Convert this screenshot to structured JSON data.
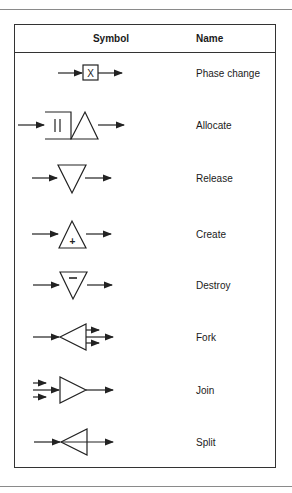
{
  "table": {
    "headers": {
      "symbol": "Symbol",
      "name": "Name"
    },
    "rows": [
      {
        "name": "Phase change",
        "symbol": "box-x-icon",
        "box_label": "X"
      },
      {
        "name": "Allocate",
        "symbol": "queue-triangle-icon",
        "queue_label": "||"
      },
      {
        "name": "Release",
        "symbol": "inverted-triangle-icon"
      },
      {
        "name": "Create",
        "symbol": "triangle-plus-icon",
        "inner": "+"
      },
      {
        "name": "Destroy",
        "symbol": "inverted-triangle-minus-icon",
        "inner": "−"
      },
      {
        "name": "Fork",
        "symbol": "fork-triangle-icon"
      },
      {
        "name": "Join",
        "symbol": "join-triangle-icon"
      },
      {
        "name": "Split",
        "symbol": "split-triangle-icon"
      }
    ]
  }
}
